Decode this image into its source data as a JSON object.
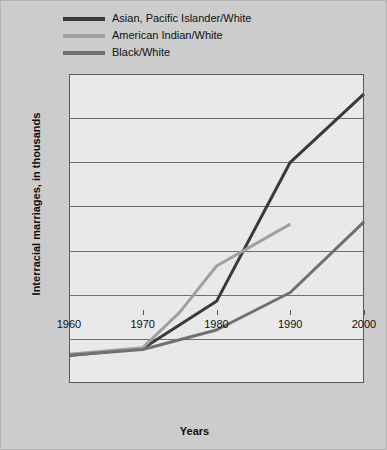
{
  "chart_data": {
    "type": "line",
    "title": "",
    "xlabel": "Years",
    "ylabel": "Interracial marriages, in thousands",
    "xlim": [
      1960,
      2000
    ],
    "ylim": [
      0,
      700
    ],
    "xticks": [
      "1960",
      "1970",
      "1980",
      "1990",
      "2000"
    ],
    "yticks": [
      "0",
      "100",
      "200",
      "300",
      "400",
      "500",
      "600",
      "700"
    ],
    "grid": true,
    "legend_position": "top-left",
    "series": [
      {
        "name": "Asian, Pacific Islander/White",
        "color": "#3a3a3a",
        "x": [
          1960,
          1970,
          1980,
          1990,
          2000
        ],
        "values": [
          62,
          78,
          185,
          500,
          655
        ]
      },
      {
        "name": "American Indian/White",
        "color": "#a0a0a0",
        "x": [
          1960,
          1970,
          1975,
          1980,
          1990
        ],
        "values": [
          65,
          80,
          160,
          265,
          360
        ]
      },
      {
        "name": "Black/White",
        "color": "#707070",
        "x": [
          1960,
          1970,
          1980,
          1990,
          2000
        ],
        "values": [
          63,
          76,
          120,
          205,
          365
        ]
      }
    ]
  }
}
